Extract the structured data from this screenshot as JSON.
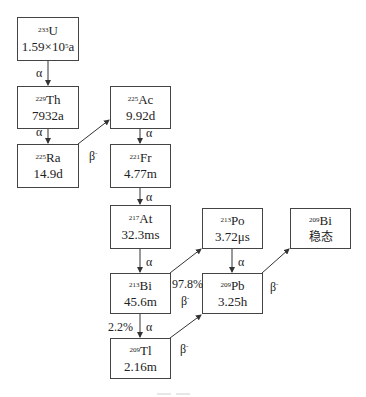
{
  "nuclides": {
    "u233": {
      "mass": "233",
      "symbol": "U",
      "halflife_pre": "1.59×10",
      "halflife_exp": "5",
      "halflife_post": "a"
    },
    "th229": {
      "mass": "229",
      "symbol": "Th",
      "halflife": "7932a"
    },
    "ra225": {
      "mass": "225",
      "symbol": "Ra",
      "halflife": "14.9d"
    },
    "ac225": {
      "mass": "225",
      "symbol": "Ac",
      "halflife": "9.92d"
    },
    "fr221": {
      "mass": "221",
      "symbol": "Fr",
      "halflife": "4.77m"
    },
    "at217": {
      "mass": "217",
      "symbol": "At",
      "halflife": "32.3ms"
    },
    "po213": {
      "mass": "213",
      "symbol": "Po",
      "halflife": "3.72μs"
    },
    "bi213": {
      "mass": "213",
      "symbol": "Bi",
      "halflife": "45.6m"
    },
    "pb209": {
      "mass": "209",
      "symbol": "Pb",
      "halflife": "3.25h"
    },
    "bi209": {
      "mass": "209",
      "symbol": "Bi",
      "halflife": "稳态"
    },
    "tl209": {
      "mass": "209",
      "symbol": "Tl",
      "halflife": "2.16m"
    }
  },
  "labels": {
    "alpha": "α",
    "beta": "β",
    "beta_sign": "-",
    "bi_to_po_branch": "97.8%",
    "bi_to_tl_branch": "2.2%"
  },
  "colors": {
    "line": "#333333",
    "border": "#444444",
    "text": "#222222"
  }
}
